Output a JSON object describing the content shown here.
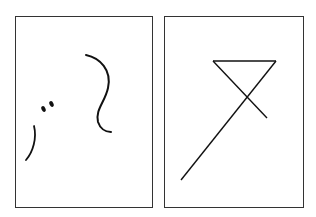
{
  "panels": [
    {
      "name": "left-panel",
      "description": "abstract curved strokes with two dots"
    },
    {
      "name": "right-panel",
      "description": "inverted triangle with crossing extended line"
    }
  ],
  "colors": {
    "stroke": "#1a1a1a",
    "background": "#ffffff"
  }
}
